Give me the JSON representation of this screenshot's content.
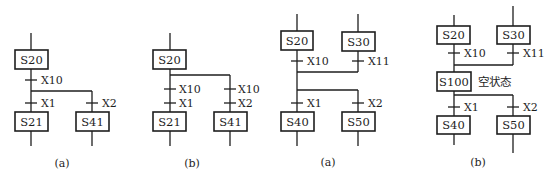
{
  "figures": [
    {
      "caption": "(a)",
      "steps": {
        "top": "S20",
        "left": "S21",
        "right": "S41"
      },
      "transitions": {
        "common": "X10",
        "left": "X1",
        "right": "X2"
      }
    },
    {
      "caption": "(b)",
      "steps": {
        "top": "S20",
        "left": "S21",
        "right": "S41"
      },
      "transitions": {
        "left_a": "X10",
        "left_b": "X1",
        "right_a": "X10",
        "right_b": "X2"
      }
    },
    {
      "caption": "(a)",
      "steps": {
        "top_left": "S20",
        "top_right": "S30",
        "bottom_left": "S40",
        "bottom_right": "S50"
      },
      "transitions": {
        "top_left": "X10",
        "top_right": "X11",
        "bottom_left": "X1",
        "bottom_right": "X2"
      }
    },
    {
      "caption": "(b)",
      "steps": {
        "top_left": "S20",
        "top_right": "S30",
        "dummy": "S100",
        "bottom_left": "S40",
        "bottom_right": "S50"
      },
      "dummy_label": "空状态",
      "transitions": {
        "top_left": "X10",
        "top_right": "X11",
        "bottom_left": "X1",
        "bottom_right": "X2"
      }
    }
  ]
}
